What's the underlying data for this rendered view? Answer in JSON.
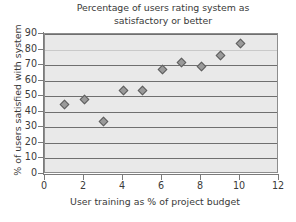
{
  "chart_data": {
    "type": "scatter",
    "title": "Percentage of users rating system as satisfactory or better",
    "title_line_1": "Percentage of users rating system as",
    "title_line_2": "satisfactory or better",
    "xlabel": "User training as % of project budget",
    "ylabel": "% of users satisfied with system",
    "xlim": [
      0,
      12
    ],
    "ylim": [
      0,
      90
    ],
    "xticks": [
      0,
      2,
      4,
      6,
      8,
      10,
      12
    ],
    "yticks": [
      0,
      10,
      20,
      30,
      40,
      50,
      60,
      70,
      80,
      90
    ],
    "grid": "horizontal",
    "legend": "none",
    "marker": "diamond",
    "marker_face_color": "#9a9a9a",
    "marker_edge_color": "#5e5e5e",
    "plot_background": "#e9e9e9",
    "gridline_color": "#6f6f6f",
    "x": [
      1,
      2,
      3,
      4,
      5,
      6,
      7,
      8,
      9,
      10
    ],
    "y": [
      45,
      48,
      34,
      54,
      54,
      67,
      72,
      69,
      76,
      84
    ],
    "points": [
      {
        "x": 1,
        "y": 45
      },
      {
        "x": 2,
        "y": 48
      },
      {
        "x": 3,
        "y": 34
      },
      {
        "x": 4,
        "y": 54
      },
      {
        "x": 5,
        "y": 54
      },
      {
        "x": 6,
        "y": 67
      },
      {
        "x": 7,
        "y": 72
      },
      {
        "x": 8,
        "y": 69
      },
      {
        "x": 9,
        "y": 76
      },
      {
        "x": 10,
        "y": 84
      }
    ]
  }
}
